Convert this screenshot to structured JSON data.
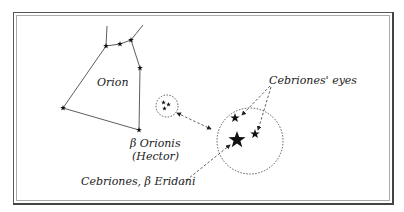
{
  "diagram": {
    "labels": {
      "orion": "Orion",
      "beta_orionis_line1": "β Orionis",
      "beta_orionis_line2": "(Hector)",
      "cebriones_eyes": "Cebriones' eyes",
      "cebriones_beta_eridani": "Cebriones, β Eridani"
    },
    "colors": {
      "line": "#333333",
      "star": "#111111",
      "frame": "#555555"
    }
  }
}
